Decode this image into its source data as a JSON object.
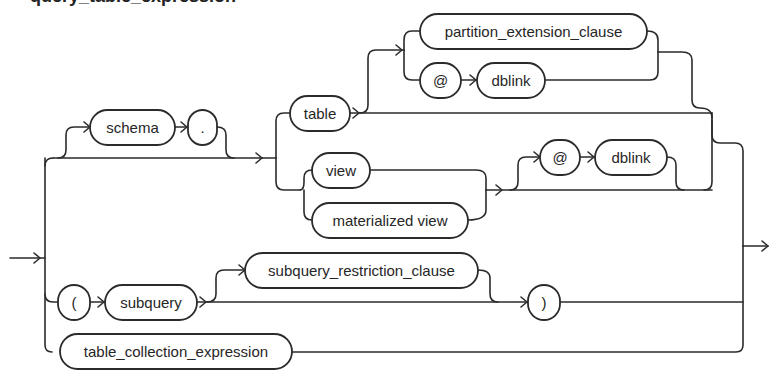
{
  "diagram": {
    "title": "query_table_expression",
    "type": "railroad-syntax-diagram",
    "nodes": {
      "schema": "schema",
      "dot": ".",
      "table": "table",
      "partition_extension_clause": "partition_extension_clause",
      "at_1": "@",
      "dblink_1": "dblink",
      "view": "view",
      "materialized_view": "materialized view",
      "at_2": "@",
      "dblink_2": "dblink",
      "open_paren": "(",
      "subquery": "subquery",
      "subquery_restriction_clause": "subquery_restriction_clause",
      "close_paren": ")",
      "table_collection_expression": "table_collection_expression"
    },
    "colors": {
      "stroke": "#2b2b2b",
      "background": "#ffffff",
      "text": "#262626"
    }
  }
}
